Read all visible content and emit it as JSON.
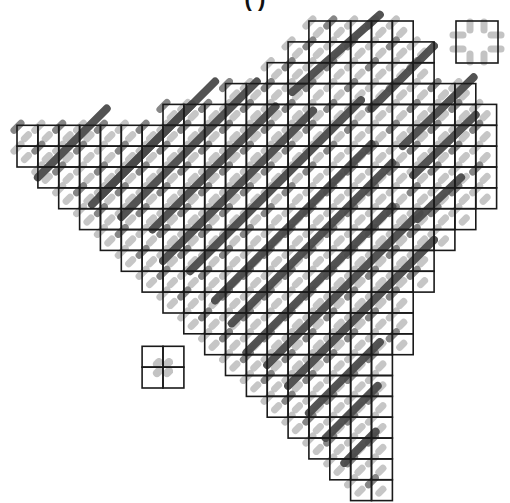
{
  "title": "   (        )",
  "grid": {
    "origin_x": 17,
    "origin_y": 21,
    "cell": 20.85,
    "line_color": "#1a1a1a",
    "rows": [
      {
        "row": 0,
        "start": 14,
        "end": 18
      },
      {
        "row": 1,
        "start": 13,
        "end": 19
      },
      {
        "row": 2,
        "start": 12,
        "end": 19
      },
      {
        "row": 3,
        "start": 10,
        "end": 21
      },
      {
        "row": 4,
        "start": 7,
        "end": 22
      },
      {
        "row": 5,
        "start": 0,
        "end": 22
      },
      {
        "row": 6,
        "start": 0,
        "end": 22
      },
      {
        "row": 7,
        "start": 1,
        "end": 22
      },
      {
        "row": 8,
        "start": 2,
        "end": 22
      },
      {
        "row": 9,
        "start": 3,
        "end": 21
      },
      {
        "row": 10,
        "start": 4,
        "end": 20
      },
      {
        "row": 11,
        "start": 5,
        "end": 19
      },
      {
        "row": 12,
        "start": 6,
        "end": 19
      },
      {
        "row": 13,
        "start": 7,
        "end": 18
      },
      {
        "row": 14,
        "start": 8,
        "end": 18
      },
      {
        "row": 15,
        "start": 9,
        "end": 18
      },
      {
        "row": 16,
        "start": 10,
        "end": 17
      },
      {
        "row": 17,
        "start": 11,
        "end": 17
      },
      {
        "row": 18,
        "start": 12,
        "end": 17
      },
      {
        "row": 19,
        "start": 13,
        "end": 17
      },
      {
        "row": 20,
        "start": 14,
        "end": 17
      },
      {
        "row": 21,
        "start": 15,
        "end": 17
      },
      {
        "row": 22,
        "start": 16,
        "end": 17
      }
    ],
    "isolated_blocks": [
      {
        "name": "small-2x2-block",
        "col": 6,
        "row": 15.6,
        "cols": 2,
        "rows": 2
      },
      {
        "name": "top-right-square",
        "x": 456,
        "y": 21,
        "size": 42
      }
    ]
  },
  "strokes": {
    "dark_color": "#4a4a4a",
    "mid_color": "#7a7a7a",
    "light_color": "#bdbdbd",
    "width": 7,
    "long_bands": [
      {
        "from": [
          3.6,
          8.8
        ],
        "to": [
          8.4,
          4.0
        ]
      },
      {
        "from": [
          1.0,
          7.5
        ],
        "to": [
          4.3,
          4.2
        ]
      },
      {
        "from": [
          4.0,
          8.4
        ],
        "to": [
          9.5,
          2.9
        ]
      },
      {
        "from": [
          5.0,
          9.4
        ],
        "to": [
          11.5,
          2.9
        ]
      },
      {
        "from": [
          6.5,
          10.0
        ],
        "to": [
          12.4,
          4.1
        ]
      },
      {
        "from": [
          7.0,
          11.5
        ],
        "to": [
          14.2,
          4.3
        ]
      },
      {
        "from": [
          8.3,
          12.0
        ],
        "to": [
          16.5,
          3.8
        ]
      },
      {
        "from": [
          9.5,
          13.4
        ],
        "to": [
          17.0,
          5.9
        ]
      },
      {
        "from": [
          10.3,
          14.5
        ],
        "to": [
          18.0,
          6.8
        ]
      },
      {
        "from": [
          11.0,
          15.9
        ],
        "to": [
          18.0,
          8.9
        ]
      },
      {
        "from": [
          12.0,
          16.5
        ],
        "to": [
          19.3,
          9.2
        ]
      },
      {
        "from": [
          13.0,
          17.5
        ],
        "to": [
          20.0,
          10.5
        ]
      },
      {
        "from": [
          14.0,
          18.8
        ],
        "to": [
          17.4,
          15.4
        ]
      },
      {
        "from": [
          14.8,
          20.0
        ],
        "to": [
          17.3,
          17.5
        ]
      },
      {
        "from": [
          15.7,
          21.2
        ],
        "to": [
          17.2,
          19.7
        ]
      },
      {
        "from": [
          13.2,
          3.4
        ],
        "to": [
          17.4,
          -0.3
        ]
      },
      {
        "from": [
          17.0,
          4.2
        ],
        "to": [
          20.0,
          1.2
        ]
      },
      {
        "from": [
          18.5,
          6.0
        ],
        "to": [
          21.9,
          2.7
        ]
      },
      {
        "from": [
          19.0,
          7.4
        ],
        "to": [
          22.0,
          4.5
        ]
      },
      {
        "from": [
          19.2,
          9.5
        ],
        "to": [
          21.3,
          7.5
        ]
      }
    ]
  }
}
